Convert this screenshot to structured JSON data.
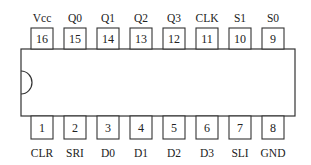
{
  "diagram": {
    "type": "dip-ic-pinout",
    "package": "DIP-16",
    "colors": {
      "stroke": "#333333",
      "text": "#222222",
      "background": "#ffffff"
    },
    "top_pins": [
      {
        "number": "16",
        "label": "Vcc"
      },
      {
        "number": "15",
        "label": "Q0"
      },
      {
        "number": "14",
        "label": "Q1"
      },
      {
        "number": "13",
        "label": "Q2"
      },
      {
        "number": "12",
        "label": "Q3"
      },
      {
        "number": "11",
        "label": "CLK"
      },
      {
        "number": "10",
        "label": "S1"
      },
      {
        "number": "9",
        "label": "S0"
      }
    ],
    "bottom_pins": [
      {
        "number": "1",
        "label": "CLR"
      },
      {
        "number": "2",
        "label": "SRI"
      },
      {
        "number": "3",
        "label": "D0"
      },
      {
        "number": "4",
        "label": "D1"
      },
      {
        "number": "5",
        "label": "D2"
      },
      {
        "number": "6",
        "label": "D3"
      },
      {
        "number": "7",
        "label": "SLI"
      },
      {
        "number": "8",
        "label": "GND"
      }
    ]
  }
}
